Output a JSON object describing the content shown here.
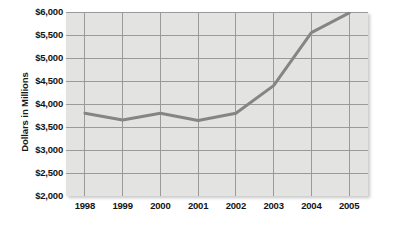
{
  "figure": {
    "name": "revenue-line-chart",
    "background_color": "#ffffff",
    "plot_background_color": "#e3e3e1",
    "grid_color": "#9a9a9a",
    "line_color": "#858585",
    "axis_text_color": "#141414"
  },
  "chart_data": {
    "type": "line",
    "title": "",
    "xlabel": "",
    "ylabel": "Dollars in Millions",
    "categories": [
      "1998",
      "1999",
      "2000",
      "2001",
      "2002",
      "2003",
      "2004",
      "2005"
    ],
    "x": [
      1998,
      1999,
      2000,
      2001,
      2002,
      2003,
      2004,
      2005
    ],
    "values": [
      3800,
      3650,
      3800,
      3640,
      3800,
      4400,
      5550,
      5980
    ],
    "series": [
      {
        "name": "Dollars in Millions",
        "values": [
          3800,
          3650,
          3800,
          3640,
          3800,
          4400,
          5550,
          5980
        ]
      }
    ],
    "ylim": [
      2000,
      6000
    ],
    "ytick_values": [
      6000,
      5500,
      5000,
      4500,
      4000,
      3500,
      3000,
      2500,
      2000
    ],
    "ytick_labels": [
      "$6,000",
      "$5,500",
      "$5,000",
      "$4,500",
      "$4,000",
      "$3,500",
      "$3,000",
      "$2,500",
      "$2,000"
    ],
    "xtick_labels": [
      "1998",
      "1999",
      "2000",
      "2001",
      "2002",
      "2003",
      "2004",
      "2005"
    ],
    "grid": true,
    "grid_x": true,
    "grid_y": true,
    "legend": false,
    "legend_position": "none",
    "markers": false,
    "line_width_px": 3
  }
}
